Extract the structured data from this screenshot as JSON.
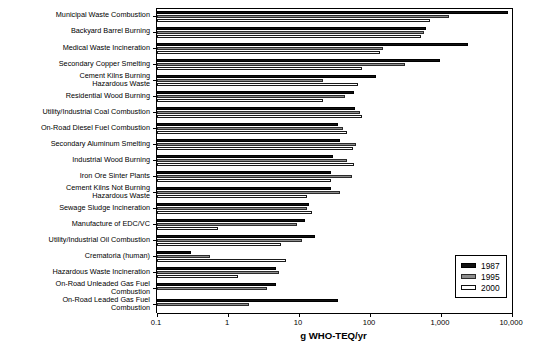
{
  "chart_data": {
    "type": "bar",
    "orientation": "horizontal",
    "title": "",
    "xlabel": "g WHO-TEQ/yr",
    "ylabel": "",
    "xscale": "log",
    "xlim": [
      0.1,
      10000
    ],
    "xticks": [
      0.1,
      1,
      10,
      100,
      1000,
      10000
    ],
    "xticklabels": [
      "0.1",
      "1",
      "10",
      "100",
      "1,000",
      "10,000"
    ],
    "grid": false,
    "legend_position": "lower right",
    "legend_entries": [
      "1987",
      "1995",
      "2000"
    ],
    "categories": [
      "Municipal Waste Combustion",
      "Backyard Barrel Burning",
      "Medical Waste Incineration",
      "Secondary Copper Smelting",
      "Cement Kilns Burning\nHazardous Waste",
      "Residential Wood Burning",
      "Utility/Industrial Coal Combustion",
      "On-Road Diesel Fuel Combustion",
      "Secondary Aluminum Smelting",
      "Industrial Wood Burning",
      "Iron Ore Sinter Plants",
      "Cement Kilns Not Burning\nHazardous Waste",
      "Sewage Sludge Incineration",
      "Manufacture of EDC/VC",
      "Utility/Industrial Oil Combustion",
      "Crematoria (human)",
      "Hazardous Waste Incineration",
      "On-Road Unleaded Gas Fuel\nCombustion",
      "On-Road Leaded Gas Fuel\nCombustion"
    ],
    "series": [
      {
        "name": "1987",
        "color": "#111111",
        "values": [
          8900,
          610,
          2400,
          980,
          120,
          60,
          62,
          36,
          38,
          30,
          28,
          28,
          14,
          12,
          17,
          0.3,
          4.8,
          4.7,
          36
        ]
      },
      {
        "name": "1995",
        "color": "#8d8d8d",
        "values": [
          1300,
          580,
          150,
          310,
          22,
          45,
          73,
          42,
          63,
          47,
          55,
          38,
          13,
          9.5,
          11,
          0.55,
          5.2,
          3.6,
          2.0
        ]
      },
      {
        "name": "2000",
        "color": "#ffffff",
        "values": [
          700,
          520,
          140,
          78,
          68,
          22,
          76,
          48,
          58,
          60,
          28,
          13,
          15,
          0.72,
          5.5,
          6.6,
          1.4,
          0,
          0
        ]
      }
    ]
  },
  "axis": {
    "title": "g WHO-TEQ/yr"
  },
  "legend": {
    "items": [
      {
        "label": "1987"
      },
      {
        "label": "1995"
      },
      {
        "label": "2000"
      }
    ]
  }
}
